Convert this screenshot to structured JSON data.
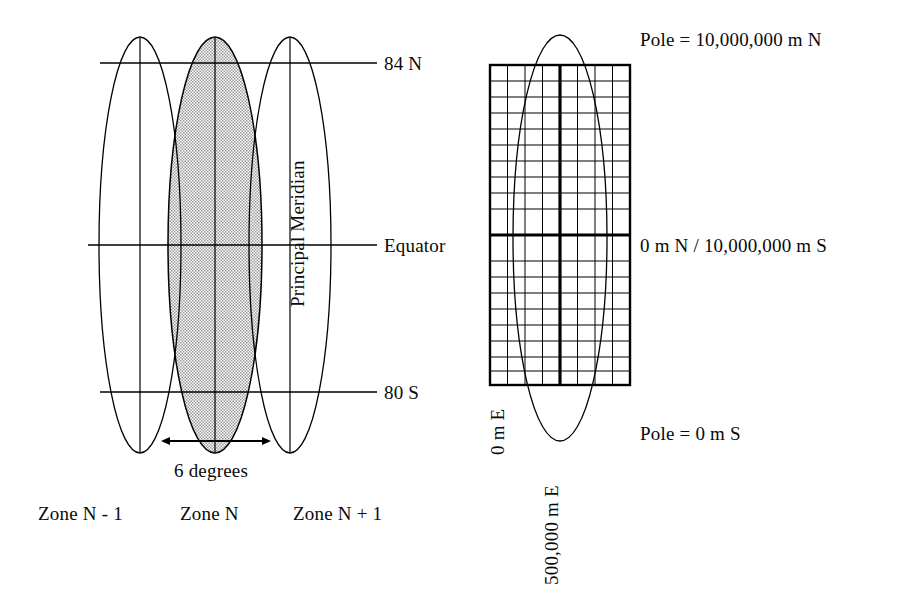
{
  "figure": {
    "background_color": "#ffffff",
    "line_color": "#000000",
    "shade_color": "#c9c9c9"
  },
  "left_diagram": {
    "name": "utm-zones-globe-gores",
    "zone_ellipses": [
      {
        "id": "zone-prev",
        "label": "Zone N - 1",
        "shaded": false
      },
      {
        "id": "zone-n",
        "label": "Zone N",
        "shaded": true
      },
      {
        "id": "zone-next",
        "label": "Zone N + 1",
        "shaded": false
      }
    ],
    "latitude_lines": [
      {
        "id": "lat-84n",
        "label": "84 N"
      },
      {
        "id": "lat-equator",
        "label": "Equator"
      },
      {
        "id": "lat-80s",
        "label": "80 S"
      }
    ],
    "meridian_label": "Principal Meridian",
    "width_annotation": {
      "label": "6 degrees",
      "arrow": "double-headed-horizontal"
    },
    "zone_labels": {
      "previous": "Zone N - 1",
      "current": "Zone N",
      "next": "Zone N + 1"
    }
  },
  "right_diagram": {
    "name": "utm-zone-grid",
    "grid": {
      "columns": 8,
      "rows": 20,
      "thick_column_index": 4,
      "thick_row_index": 10
    },
    "northing_labels": {
      "pole_north": "Pole = 10,000,000 m N",
      "equator": "0 m N / 10,000,000 m S",
      "pole_south": "Pole = 0 m S"
    },
    "easting_labels": {
      "west_edge": "0 m E",
      "central_meridian": "500,000 m E"
    }
  }
}
